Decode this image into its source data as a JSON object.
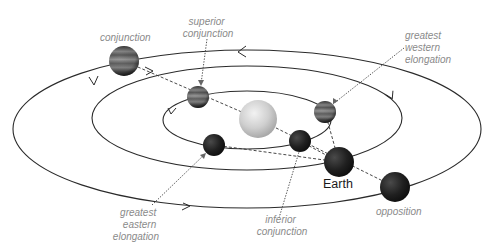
{
  "diagram": {
    "labels": {
      "conjunction": "conjunction",
      "superior_conjunction": [
        "superior",
        "conjunction"
      ],
      "greatest_western_elongation": [
        "greatest",
        "western",
        "elongation"
      ],
      "greatest_eastern_elongation": [
        "greatest",
        "eastern",
        "elongation"
      ],
      "inferior_conjunction": [
        "inferior",
        "conjunction"
      ],
      "opposition": "opposition",
      "earth": "Earth"
    },
    "orbits": [
      {
        "name": "outer-planet-orbit",
        "cx": 247,
        "cy": 129,
        "rx": 234,
        "ry": 79
      },
      {
        "name": "earth-orbit",
        "cx": 247,
        "cy": 118,
        "rx": 155,
        "ry": 52
      },
      {
        "name": "inner-planet-orbit",
        "cx": 247,
        "cy": 120,
        "rx": 84,
        "ry": 29
      }
    ],
    "bodies": [
      {
        "name": "sun",
        "x": 258,
        "y": 119,
        "r": 19
      },
      {
        "name": "outer-planet-conjunction",
        "x": 124,
        "y": 61,
        "r": 15
      },
      {
        "name": "inner-planet-superior-conjunction",
        "x": 198,
        "y": 97,
        "r": 11
      },
      {
        "name": "inner-planet-greatest-western-elongation",
        "x": 325,
        "y": 112,
        "r": 11
      },
      {
        "name": "inner-planet-greatest-eastern-elongation",
        "x": 214,
        "y": 145,
        "r": 11
      },
      {
        "name": "inner-planet-inferior-conjunction",
        "x": 300,
        "y": 141,
        "r": 11
      },
      {
        "name": "earth",
        "x": 339,
        "y": 162,
        "r": 15
      },
      {
        "name": "outer-planet-opposition",
        "x": 395,
        "y": 187,
        "r": 15
      }
    ],
    "colors": {
      "orbit": "#2a2a2a",
      "label": "#8a8a8a",
      "sun": "#c8c8c8",
      "planet_dark": "#1e1e1e",
      "planet_banded": "#6e6e6e"
    }
  }
}
